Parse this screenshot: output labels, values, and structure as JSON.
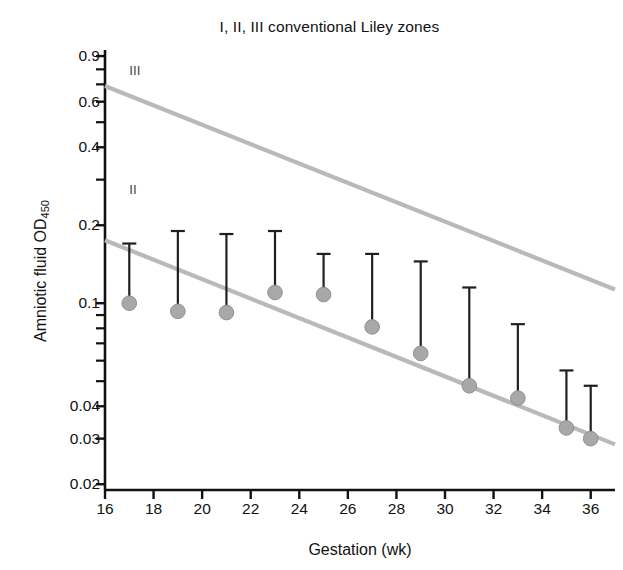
{
  "figure": {
    "title": "I, II, III conventional Liley zones",
    "xlabel": "Gestation (wk)",
    "ylabel_main": "Amniotic fluid  OD",
    "ylabel_sub": "450"
  },
  "zone_labels": [
    {
      "text": "III",
      "x": 17.0,
      "y": 0.78
    },
    {
      "text": "II",
      "x": 17.0,
      "y": 0.27
    }
  ],
  "axis": {
    "x_ticks": [
      16,
      18,
      20,
      22,
      24,
      26,
      28,
      30,
      32,
      34,
      36
    ],
    "y_ticks_labeled": [
      0.9,
      0.6,
      0.4,
      0.2,
      0.1,
      0.04,
      0.03,
      0.02
    ],
    "y_ticks_minor": [
      0.8,
      0.7,
      0.5,
      0.3,
      0.09,
      0.08,
      0.07,
      0.06,
      0.05
    ],
    "xlim": [
      16,
      37
    ],
    "ylim": [
      0.019,
      0.95
    ]
  },
  "colors": {
    "marker": "#a8a8a8",
    "marker_edge": "#8f8f8f",
    "errorbar": "#1f1f1f",
    "zone_line": "#b9b9b9",
    "axis": "#111111",
    "background": "#ffffff"
  },
  "chart_data": {
    "type": "scatter",
    "title": "I, II, III conventional Liley zones",
    "xlabel": "Gestation (wk)",
    "ylabel": "Amniotic fluid OD450",
    "xlim": [
      16,
      37
    ],
    "ylim": [
      0.019,
      0.95
    ],
    "yscale": "log",
    "grid": false,
    "legend": "none",
    "x": [
      17,
      19,
      21,
      23,
      25,
      27,
      29,
      31,
      33,
      35,
      36
    ],
    "values": [
      0.1,
      0.093,
      0.092,
      0.11,
      0.108,
      0.081,
      0.064,
      0.048,
      0.043,
      0.033,
      0.03
    ],
    "error_upper": [
      0.17,
      0.19,
      0.185,
      0.19,
      0.155,
      0.155,
      0.145,
      0.115,
      0.083,
      0.055,
      0.048
    ],
    "series": [
      {
        "name": "Amniotic fluid OD450 (median with upper range)",
        "x": [
          17,
          19,
          21,
          23,
          25,
          27,
          29,
          31,
          33,
          35,
          36
        ],
        "values": [
          0.1,
          0.093,
          0.092,
          0.11,
          0.108,
          0.081,
          0.064,
          0.048,
          0.043,
          0.033,
          0.03
        ],
        "error_upper": [
          0.17,
          0.19,
          0.185,
          0.19,
          0.155,
          0.155,
          0.145,
          0.115,
          0.083,
          0.055,
          0.048
        ]
      },
      {
        "name": "Liley zone II / III boundary",
        "type": "line",
        "x": [
          16,
          37
        ],
        "values": [
          0.69,
          0.113
        ]
      },
      {
        "name": "Liley zone I / II boundary",
        "type": "line",
        "x": [
          16,
          37
        ],
        "values": [
          0.175,
          0.0285
        ]
      }
    ],
    "annotations": [
      {
        "text": "III",
        "x": 17.0,
        "y": 0.78
      },
      {
        "text": "II",
        "x": 17.0,
        "y": 0.27
      }
    ]
  }
}
